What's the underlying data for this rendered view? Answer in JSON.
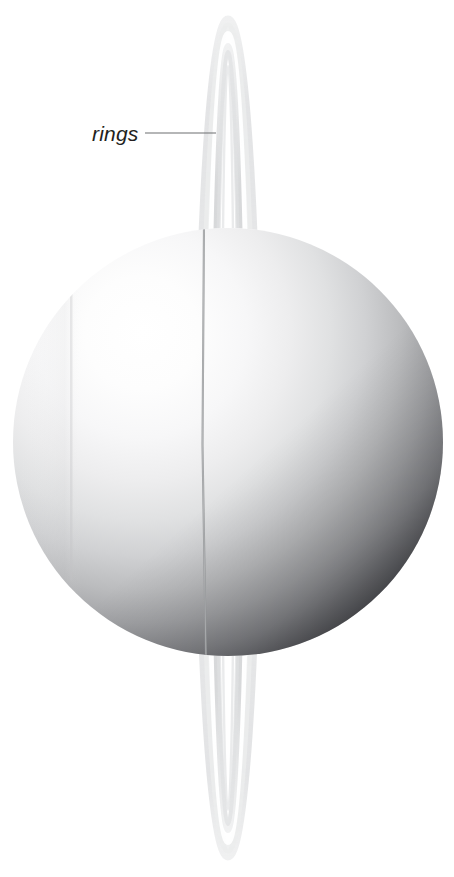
{
  "figure": {
    "background_color": "#ffffff",
    "canvas": {
      "width": 454,
      "height": 877
    }
  },
  "annotations": [
    {
      "id": "rings",
      "label": "rings",
      "text_color": "#231f20",
      "leader_line_color": "#6d6e71",
      "text_anchor_x": 92,
      "text_baseline_y": 141,
      "leader_start_x": 145,
      "leader_end_x": 216,
      "leader_y": 133
    }
  ],
  "planet": {
    "name": "uranus-sphere",
    "center_x": 228,
    "center_y": 442,
    "radius_x": 215,
    "radius_y": 214,
    "highlight_x": 138,
    "highlight_y": 330,
    "highlight_color": "#ffffff",
    "midtone_color": "#c9cacb",
    "shadow_color": "#050505",
    "terminator_color": "#000000"
  },
  "rings": {
    "name": "ring-system",
    "orientation": "vertical",
    "top_apex_y": 20,
    "bottom_apex_y": 856,
    "center_x": 228,
    "max_half_width": 29,
    "outer_band_color": "#e8e9ea",
    "inner_band_color": "#d5d7d8",
    "gap_color": "#ffffff",
    "front_arc_color": "#b9babb",
    "bands": [
      {
        "id": "outer-ring",
        "half_width": 29,
        "opacity": 0.95
      },
      {
        "id": "gap",
        "half_width": 19,
        "opacity": 1.0
      },
      {
        "id": "inner-ring",
        "half_width": 13,
        "opacity": 0.85
      }
    ]
  },
  "ring_front_line": {
    "name": "ring-front-edge-over-planet",
    "x": 203,
    "top_y": 228,
    "bottom_y": 656,
    "color": "#9a9b9d"
  }
}
